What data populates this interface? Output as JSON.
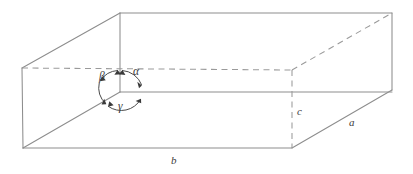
{
  "figure": {
    "name": "unit-cell-axes-diagram",
    "type": "line-diagram",
    "stroke_color": "#8d8d8d",
    "dashed_stroke_color": "#9a9a9a",
    "arc_color": "#4b4b4b",
    "label_color": "#3c3c3c",
    "background_color": "#ffffff"
  },
  "edge_labels": [
    {
      "id": "a",
      "text": "a",
      "meaning": "edge-length-a",
      "edge": "bottom-right-receding-edge"
    },
    {
      "id": "b",
      "text": "b",
      "meaning": "edge-length-b",
      "edge": "bottom-front-horizontal-edge"
    },
    {
      "id": "c",
      "text": "c",
      "meaning": "edge-length-c",
      "edge": "hidden-vertical-edge"
    }
  ],
  "angle_labels": [
    {
      "id": "alpha",
      "text": "α",
      "meaning": "interaxial-angle-alpha"
    },
    {
      "id": "beta",
      "text": "β",
      "meaning": "interaxial-angle-beta"
    },
    {
      "id": "gamma",
      "text": "γ",
      "meaning": "interaxial-angle-gamma"
    }
  ],
  "geometry": {
    "vertices": {
      "top_front_left": [
        120,
        13
      ],
      "top_front_right": [
        392,
        13
      ],
      "top_back_left": [
        22,
        68
      ],
      "top_back_right": [
        292,
        70
      ],
      "bottom_front_left": [
        120,
        92
      ],
      "bottom_front_right": [
        392,
        90
      ],
      "bottom_back_left": [
        23,
        148
      ],
      "bottom_back_right": [
        292,
        148
      ]
    }
  }
}
